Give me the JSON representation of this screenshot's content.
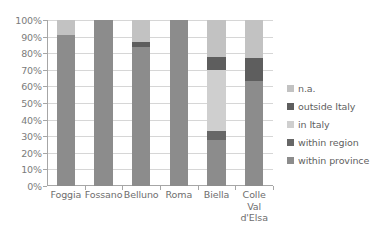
{
  "chart_data": {
    "type": "bar",
    "subtype": "100%-stacked-column",
    "title": "",
    "xlabel": "",
    "ylabel": "",
    "ylim": [
      0,
      100
    ],
    "grid": true,
    "legend_position": "right",
    "categories": [
      "Foggia",
      "Fossano",
      "Belluno",
      "Roma",
      "Biella",
      "Colle Val d'Elsa"
    ],
    "category_lines": [
      [
        "Foggia"
      ],
      [
        "Fossano"
      ],
      [
        "Belluno"
      ],
      [
        "Roma"
      ],
      [
        "Biella"
      ],
      [
        "Colle",
        "Val",
        "d'Elsa"
      ]
    ],
    "ytick_labels": [
      "100%",
      "90%",
      "80%",
      "70%",
      "60%",
      "50%",
      "40%",
      "30%",
      "20%",
      "10%",
      "0%"
    ],
    "ytick_values": [
      100,
      90,
      80,
      70,
      60,
      50,
      40,
      30,
      20,
      10,
      0
    ],
    "series": [
      {
        "name": "within province",
        "color": "#8c8c8c",
        "values": [
          91,
          100,
          84,
          100,
          28,
          63
        ]
      },
      {
        "name": "within region",
        "color": "#676767",
        "values": [
          0,
          0,
          0,
          0,
          5,
          0
        ]
      },
      {
        "name": "in Italy",
        "color": "#cfcfcf",
        "values": [
          0,
          0,
          0,
          0,
          37,
          0
        ]
      },
      {
        "name": "outside Italy",
        "color": "#5e5e5e",
        "values": [
          0,
          0,
          3,
          0,
          8,
          14
        ]
      },
      {
        "name": "n.a.",
        "color": "#c2c2c2",
        "values": [
          9,
          0,
          13,
          0,
          22,
          23
        ]
      }
    ],
    "legend_entries": [
      {
        "label": "n.a.",
        "color": "#c2c2c2"
      },
      {
        "label": "outside Italy",
        "color": "#5e5e5e"
      },
      {
        "label": "in Italy",
        "color": "#cfcfcf"
      },
      {
        "label": "within region",
        "color": "#676767"
      },
      {
        "label": "within province",
        "color": "#8c8c8c"
      }
    ],
    "stack_order_bottom_to_top": [
      "within province",
      "within region",
      "in Italy",
      "outside Italy",
      "n.a."
    ],
    "colors": {
      "gridline": "#d6d6d6",
      "axis": "#a6a6a6",
      "tick_text": "#7b7b7b",
      "legend_text": "#5f5f5f",
      "background": "#ffffff"
    }
  }
}
